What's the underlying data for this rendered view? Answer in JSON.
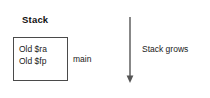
{
  "diagram": {
    "title": "Stack",
    "frame": {
      "label": "main",
      "rows": [
        {
          "text": "Old $ra"
        },
        {
          "text": "Old $fp"
        }
      ],
      "border_color": "#4a4a4a",
      "fill_color": "#ffffff"
    },
    "arrow": {
      "label": "Stack grows",
      "direction": "down",
      "color": "#555555"
    },
    "background_color": "#ffffff",
    "text_color": "#1a1a1a"
  }
}
